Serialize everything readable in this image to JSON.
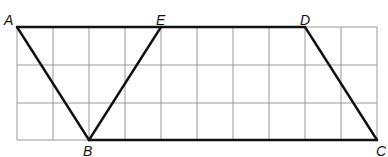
{
  "diagram": {
    "grid": {
      "columns": 10,
      "rows": 3,
      "origin_x": 17,
      "origin_y": 27,
      "cell_w": 36,
      "cell_h": 37.7,
      "line_color": "#9a9a9a"
    },
    "stroke_color": "#111111",
    "points": {
      "A": {
        "label": "A",
        "col": 0,
        "row": 0
      },
      "E": {
        "label": "E",
        "col": 4,
        "row": 0
      },
      "D": {
        "label": "D",
        "col": 8,
        "row": 0
      },
      "B": {
        "label": "B",
        "col": 2,
        "row": 3
      },
      "C": {
        "label": "C",
        "col": 10,
        "row": 3
      }
    },
    "segments": [
      [
        "A",
        "D"
      ],
      [
        "A",
        "B"
      ],
      [
        "B",
        "E"
      ],
      [
        "B",
        "C"
      ],
      [
        "D",
        "C"
      ]
    ]
  }
}
